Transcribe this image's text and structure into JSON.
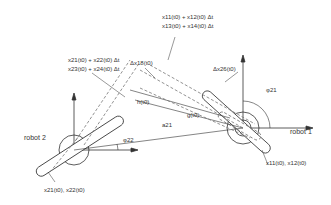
{
  "figure": {
    "robots": [
      {
        "id": "robot-1",
        "label": "robot 1",
        "angle_label": "φ21",
        "pos_label": "x11(t0), x12(t0)"
      },
      {
        "id": "robot-2",
        "label": "robot 2",
        "angle_label": "φ22",
        "pos_label": "x21(t0), x22(t0)"
      }
    ],
    "labels": {
      "robot1": "robot 1",
      "robot2": "robot 2",
      "phi21": "φ21",
      "phi22": "φ22",
      "a21": "a21",
      "g": "g(t0)",
      "h": "h(t0)",
      "dx18": "Δx18(t0)",
      "dx26": "Δx26(t0)",
      "top_right_line1": "x11(t0) + x12(t0) Δt",
      "top_right_line2": "x13(t0) + x14(t0) Δt",
      "top_left_line1": "x21(t0) + x22(t0) Δt",
      "top_left_line2": "x23(t0) + x24(t0) Δt",
      "pos1": "x11(t0), x12(t0)",
      "pos2": "x21(t0), x22(t0)"
    },
    "colors": {
      "line": "#333333",
      "dashed": "#777777",
      "background": "#ffffff"
    }
  }
}
